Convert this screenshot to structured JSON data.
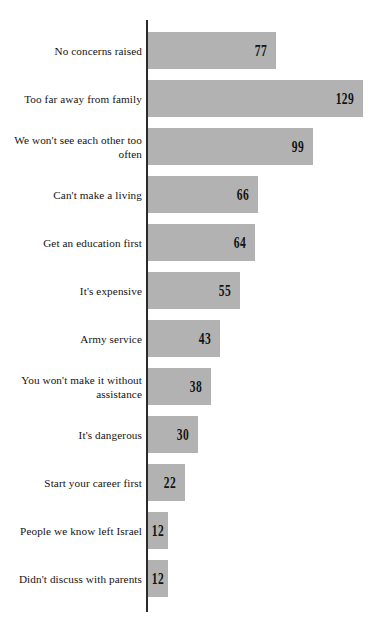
{
  "chart": {
    "title": "",
    "background_color": "#ffffff",
    "bar_color": "#b2b2b2",
    "axis_color": "#2b2b2b",
    "value_label_color": "#121212",
    "category_label_color": "#16120f"
  },
  "chart_data": {
    "type": "bar",
    "orientation": "horizontal",
    "title": "",
    "subtitle": "",
    "xlabel": "",
    "ylabel": "",
    "xlim": [
      0,
      140
    ],
    "grid": false,
    "legend": false,
    "categories": [
      "No concerns raised",
      "Too far away from family",
      "We won't see each other too\noften",
      "Can't make a living",
      "Get an education first",
      "It's expensive",
      "Army service",
      "You won't make it without\nassistance",
      "It's dangerous",
      "Start your career first",
      "People we know left Israel",
      "Didn't discuss with parents"
    ],
    "values": [
      77,
      129,
      99,
      66,
      64,
      55,
      43,
      38,
      30,
      22,
      12,
      12
    ],
    "value_labels": [
      "77",
      "129",
      "99",
      "66",
      "64",
      "55",
      "43",
      "38",
      "30",
      "22",
      "12",
      "12"
    ],
    "series": [
      {
        "name": "Count",
        "values": [
          77,
          129,
          99,
          66,
          64,
          55,
          43,
          38,
          30,
          22,
          12,
          12
        ]
      }
    ],
    "annotations": []
  }
}
